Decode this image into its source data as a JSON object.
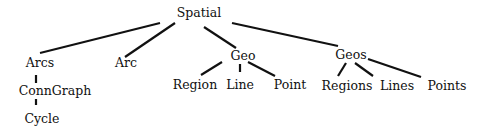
{
  "diagram": {
    "type": "tree",
    "title": "",
    "nodes": [
      {
        "id": "spatial",
        "label": "Spatial",
        "x": 199,
        "y": 13
      },
      {
        "id": "arcs",
        "label": "Arcs",
        "x": 40,
        "y": 63
      },
      {
        "id": "arc",
        "label": "Arc",
        "x": 126,
        "y": 63
      },
      {
        "id": "geo",
        "label": "Geo",
        "x": 243,
        "y": 56
      },
      {
        "id": "geos",
        "label": "Geos",
        "x": 351,
        "y": 55
      },
      {
        "id": "region",
        "label": "Region",
        "x": 195,
        "y": 85
      },
      {
        "id": "line",
        "label": "Line",
        "x": 240,
        "y": 85
      },
      {
        "id": "point",
        "label": "Point",
        "x": 290,
        "y": 85
      },
      {
        "id": "regions",
        "label": "Regions",
        "x": 347,
        "y": 86
      },
      {
        "id": "lines",
        "label": "Lines",
        "x": 397,
        "y": 86
      },
      {
        "id": "points",
        "label": "Points",
        "x": 447,
        "y": 86
      },
      {
        "id": "conngraph",
        "label": "ConnGraph",
        "x": 55,
        "y": 91
      },
      {
        "id": "cycle",
        "label": "Cycle",
        "x": 42,
        "y": 119
      }
    ],
    "edges": [
      {
        "from": "spatial",
        "to": "arcs",
        "x1": 160,
        "y1": 23,
        "x2": 40,
        "y2": 53
      },
      {
        "from": "spatial",
        "to": "arc",
        "x1": 175,
        "y1": 23,
        "x2": 125,
        "y2": 57
      },
      {
        "from": "spatial",
        "to": "geo",
        "x1": 204,
        "y1": 27,
        "x2": 236,
        "y2": 48
      },
      {
        "from": "spatial",
        "to": "geos",
        "x1": 232,
        "y1": 23,
        "x2": 338,
        "y2": 46
      },
      {
        "from": "geo",
        "to": "region",
        "x1": 222,
        "y1": 62,
        "x2": 201,
        "y2": 75
      },
      {
        "from": "geo",
        "to": "line",
        "x1": 240,
        "y1": 64,
        "x2": 240,
        "y2": 72
      },
      {
        "from": "geo",
        "to": "point",
        "x1": 248,
        "y1": 62,
        "x2": 275,
        "y2": 76
      },
      {
        "from": "geos",
        "to": "regions",
        "x1": 346,
        "y1": 63,
        "x2": 338,
        "y2": 76
      },
      {
        "from": "geos",
        "to": "lines",
        "x1": 355,
        "y1": 63,
        "x2": 373,
        "y2": 76
      },
      {
        "from": "geos",
        "to": "points",
        "x1": 368,
        "y1": 59,
        "x2": 421,
        "y2": 77
      },
      {
        "from": "arcs",
        "to": "conngraph",
        "x1": 36,
        "y1": 75,
        "x2": 36,
        "y2": 83
      },
      {
        "from": "conngraph",
        "to": "cycle",
        "x1": 36,
        "y1": 99,
        "x2": 36,
        "y2": 105
      }
    ]
  }
}
